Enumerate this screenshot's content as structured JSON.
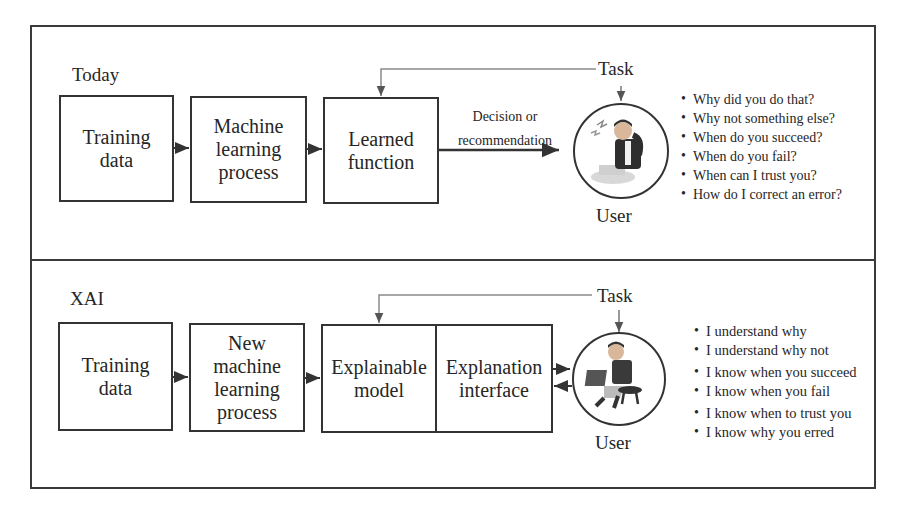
{
  "today": {
    "section_label": "Today",
    "boxes": [
      {
        "label": "Training\ndata"
      },
      {
        "label": "Machine\nlearning\nprocess"
      },
      {
        "label": "Learned\nfunction"
      }
    ],
    "edge_label": "Decision or\nrecommendation",
    "task_label": "Task",
    "user_label": "User",
    "user_icon": "confused-user-icon",
    "questions": [
      "Why did you do that?",
      "Why not something else?",
      "When do you succeed?",
      "When do you fail?",
      "When can I trust you?",
      "How do I correct an error?"
    ]
  },
  "xai": {
    "section_label": "XAI",
    "boxes": [
      {
        "label": "Training\ndata"
      },
      {
        "label": "New\nmachine\nlearning\nprocess"
      },
      {
        "label": "Explainable\nmodel"
      },
      {
        "label": "Explanation\ninterface"
      }
    ],
    "task_label": "Task",
    "user_label": "User",
    "user_icon": "satisfied-user-icon",
    "statements": [
      "I understand why",
      "I understand why not",
      "I know when you succeed",
      "I know when you fail",
      "I know when to trust you",
      "I know why you erred"
    ]
  },
  "colors": {
    "stroke": "#333333",
    "task_line": "#8a8a8a",
    "text": "#262626"
  }
}
